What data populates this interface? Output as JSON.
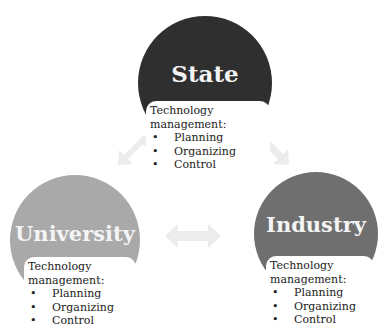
{
  "diagram": {
    "nodes": [
      {
        "id": "state",
        "title": "State",
        "color": "#2f2f2f",
        "card": {
          "heading_line1": "Technology",
          "heading_line2": "management:",
          "items": [
            "Planning",
            "Organizing",
            "Control"
          ]
        }
      },
      {
        "id": "university",
        "title": "University",
        "color": "#a9a9a9",
        "card": {
          "heading_line1": "Technology",
          "heading_line2": "management:",
          "items": [
            "Planning",
            "Organizing",
            "Control"
          ]
        }
      },
      {
        "id": "industry",
        "title": "Industry",
        "color": "#6f6f6f",
        "card": {
          "heading_line1": "Technology",
          "heading_line2": "management:",
          "items": [
            "Planning",
            "Organizing",
            "Control"
          ]
        }
      }
    ],
    "connections": [
      {
        "from": "state",
        "to": "university",
        "type": "bidirectional-arrow"
      },
      {
        "from": "state",
        "to": "industry",
        "type": "bidirectional-arrow"
      },
      {
        "from": "university",
        "to": "industry",
        "type": "bidirectional-arrow"
      }
    ],
    "arrow_color": "#ececec"
  }
}
